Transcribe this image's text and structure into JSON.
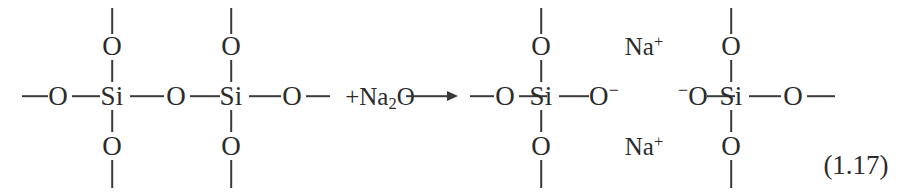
{
  "figure": {
    "kind": "chemical-reaction-equation",
    "background_color": "#ffffff",
    "text_color": "#2b2b2b",
    "bond_color": "#3a3a3a",
    "equation_tag": "(1.17)"
  },
  "reactant": {
    "chain_terminal_left": "—",
    "chain_terminal_right": "—",
    "atoms": {
      "bridging_oxygen_left": "O",
      "silicon_1": "Si",
      "bridging_oxygen_center": "O",
      "silicon_2": "Si",
      "bridging_oxygen_right": "O",
      "pendant_oxygen_top_1": "O",
      "pendant_oxygen_bottom_1": "O",
      "pendant_oxygen_top_2": "O",
      "pendant_oxygen_bottom_2": "O"
    }
  },
  "added_reagent": {
    "plus_sign": "+",
    "formula_text": "Na",
    "formula_subscript": "2",
    "formula_tail": "O",
    "full_label": "+Na2O"
  },
  "arrow": {
    "glyph": "→",
    "label": "yields"
  },
  "product": {
    "atoms": {
      "bridging_oxygen_left": "O",
      "silicon_3": "Si",
      "pendant_oxygen_top_3": "O",
      "pendant_oxygen_bottom_3": "O",
      "nonbridging_oxygen_right": "O",
      "nonbridging_charge_right": "−",
      "nonbridging_oxygen_left2": "O",
      "nonbridging_charge_left2": "−",
      "silicon_4": "Si",
      "pendant_oxygen_top_4": "O",
      "pendant_oxygen_bottom_4": "O",
      "bridging_oxygen_far_right": "O"
    },
    "counter_ions": {
      "top": {
        "element": "Na",
        "charge": "+"
      },
      "bottom": {
        "element": "Na",
        "charge": "+"
      }
    }
  }
}
